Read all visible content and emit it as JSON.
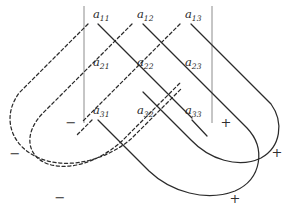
{
  "figure": {
    "name": "rule-of-sarrus-diagram",
    "width": 290,
    "height": 218,
    "background": "#ffffff",
    "line_color": "#2b2b2b",
    "bar_color": "#8c8c8c",
    "text_color": "#2a2a2a"
  },
  "matrix": {
    "rows": 3,
    "cols": 3,
    "entries": [
      {
        "id": "a11",
        "base": "a",
        "sub": "11",
        "x": 93,
        "y": 18,
        "col": 1,
        "row": 1
      },
      {
        "id": "a12",
        "base": "a",
        "sub": "12",
        "x": 137,
        "y": 18,
        "col": 2,
        "row": 1
      },
      {
        "id": "a13",
        "base": "a",
        "sub": "13",
        "x": 185,
        "y": 18,
        "col": 3,
        "row": 1
      },
      {
        "id": "a21",
        "base": "a",
        "sub": "21",
        "x": 93,
        "y": 66,
        "col": 1,
        "row": 2
      },
      {
        "id": "a22",
        "base": "a",
        "sub": "22",
        "x": 137,
        "y": 66,
        "col": 2,
        "row": 2
      },
      {
        "id": "a23",
        "base": "a",
        "sub": "23",
        "x": 185,
        "y": 66,
        "col": 3,
        "row": 2
      },
      {
        "id": "a31",
        "base": "a",
        "sub": "31",
        "x": 93,
        "y": 114,
        "col": 1,
        "row": 3
      },
      {
        "id": "a32",
        "base": "a",
        "sub": "32",
        "x": 137,
        "y": 114,
        "col": 2,
        "row": 3
      },
      {
        "id": "a33",
        "base": "a",
        "sub": "33",
        "x": 185,
        "y": 114,
        "col": 3,
        "row": 3
      }
    ]
  },
  "determinant_bars": [
    {
      "id": "left-bar",
      "x": 84,
      "y1": 6,
      "y2": 123
    },
    {
      "id": "right-bar",
      "x": 212,
      "y1": 6,
      "y2": 123
    }
  ],
  "signs": [
    {
      "id": "minus-1",
      "symbol": "−",
      "x": 71,
      "y": 127,
      "polarity": "negative"
    },
    {
      "id": "minus-2",
      "symbol": "−",
      "x": 15,
      "y": 158,
      "polarity": "negative"
    },
    {
      "id": "minus-3",
      "symbol": "−",
      "x": 60,
      "y": 202,
      "polarity": "negative"
    },
    {
      "id": "plus-1",
      "symbol": "+",
      "x": 226,
      "y": 127,
      "polarity": "positive"
    },
    {
      "id": "plus-2",
      "symbol": "+",
      "x": 277,
      "y": 157,
      "polarity": "positive"
    },
    {
      "id": "plus-3",
      "symbol": "+",
      "x": 235,
      "y": 203,
      "polarity": "positive"
    }
  ],
  "positive_diagonals": [
    {
      "id": "pos-main-diagonal",
      "terms": [
        "a11",
        "a22",
        "a33"
      ],
      "sign": "plus-1",
      "path": "M 98 24 L 211 137"
    },
    {
      "id": "pos-wrap-diagonal-1",
      "terms": [
        "a12",
        "a23",
        "a31"
      ],
      "sign": "plus-3",
      "path": "M 143 24 L 248 129 C 265 148 262 178 236 190 C 208 202 172 193 150 172 L 98 120"
    },
    {
      "id": "pos-wrap-diagonal-2",
      "terms": [
        "a13",
        "a21",
        "a32"
      ],
      "sign": "plus-2",
      "path": "M 191 24 L 270 103 C 283 120 281 146 262 157 C 240 169 210 160 192 141 L 143 92"
    }
  ],
  "negative_diagonals": [
    {
      "id": "neg-anti-diagonal",
      "terms": [
        "a13",
        "a22",
        "a31"
      ],
      "sign": "minus-1",
      "path": "M 180 24 L 83 121"
    },
    {
      "id": "neg-wrap-diagonal-1",
      "terms": [
        "a12",
        "a21",
        "a33"
      ],
      "sign": "minus-2",
      "path": "M 132 24 L 40 116 C 24 134 26 155 46 163 C 70 172 102 160 122 141 L 180 83"
    },
    {
      "id": "neg-wrap-diagonal-2",
      "terms": [
        "a11",
        "a32",
        "a23"
      ],
      "sign": "minus-3",
      "path": "M 88 24 L 20 92 C 4 112 8 140 32 154 C 62 171 104 161 130 140 L 180 90"
    }
  ],
  "short_segments": [
    {
      "id": "seg-a33-tail",
      "type": "positive",
      "path": "M 191 120 L 206 136"
    },
    {
      "id": "seg-a31-head",
      "type": "negative",
      "path": "M 92 120 L 78 134"
    }
  ]
}
